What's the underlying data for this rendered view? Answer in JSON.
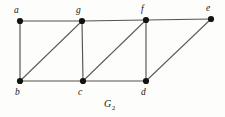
{
  "figure": {
    "caption_main": "G",
    "caption_subscript": "2",
    "caption_full": "G2",
    "background_color": "#fdfdfc",
    "edge_color": "#55534f",
    "vertex_color": "#15130f",
    "label_color": "#17150f"
  },
  "graph_data": {
    "type": "undirected-graph",
    "vertex_count": 7,
    "edge_count": 11,
    "vertices": [
      {
        "id": "a",
        "label": "a",
        "x": 20,
        "y": 21,
        "label_x": 14,
        "label_y": 13,
        "row": "top"
      },
      {
        "id": "g",
        "label": "g",
        "x": 82,
        "y": 21,
        "label_x": 76,
        "label_y": 13,
        "row": "top"
      },
      {
        "id": "f",
        "label": "f",
        "x": 146,
        "y": 20,
        "label_x": 141,
        "label_y": 12,
        "row": "top"
      },
      {
        "id": "e",
        "label": "e",
        "x": 211,
        "y": 19,
        "label_x": 206,
        "label_y": 11,
        "row": "top"
      },
      {
        "id": "b",
        "label": "b",
        "x": 20,
        "y": 81,
        "label_x": 15,
        "label_y": 95,
        "row": "bottom"
      },
      {
        "id": "c",
        "label": "c",
        "x": 83,
        "y": 81,
        "label_x": 78,
        "label_y": 95,
        "row": "bottom"
      },
      {
        "id": "d",
        "label": "d",
        "x": 146,
        "y": 81,
        "label_x": 141,
        "label_y": 95,
        "row": "bottom"
      }
    ],
    "edges": [
      {
        "from": "a",
        "to": "g",
        "kind": "horizontal-top"
      },
      {
        "from": "g",
        "to": "f",
        "kind": "horizontal-top"
      },
      {
        "from": "f",
        "to": "e",
        "kind": "horizontal-top"
      },
      {
        "from": "b",
        "to": "c",
        "kind": "horizontal-bottom"
      },
      {
        "from": "c",
        "to": "d",
        "kind": "horizontal-bottom"
      },
      {
        "from": "a",
        "to": "b",
        "kind": "vertical"
      },
      {
        "from": "g",
        "to": "c",
        "kind": "vertical"
      },
      {
        "from": "f",
        "to": "d",
        "kind": "vertical"
      },
      {
        "from": "b",
        "to": "g",
        "kind": "diagonal"
      },
      {
        "from": "c",
        "to": "f",
        "kind": "diagonal"
      },
      {
        "from": "d",
        "to": "e",
        "kind": "diagonal"
      }
    ],
    "vertex_radius": 3.1
  }
}
